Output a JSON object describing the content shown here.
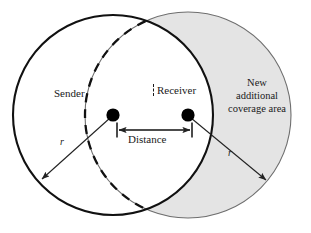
{
  "figure": {
    "type": "geometry-diagram",
    "background_color": "#ffffff"
  },
  "colors": {
    "stroke_primary": "#111111",
    "stroke_secondary": "#555555",
    "shaded_area_fill": "#e4e4e4",
    "shaded_area_stroke": "#6e6e6e",
    "node_fill": "#000000",
    "text": "#1a1a1a"
  },
  "shapes": {
    "sender_circle": {
      "name": "sender-coverage-circle",
      "cx": 113,
      "cy": 115,
      "r": 100,
      "stroke": "solid",
      "fill": "none"
    },
    "receiver_circle": {
      "name": "receiver-coverage-circle",
      "cx": 188,
      "cy": 115,
      "r": 103,
      "stroke": "solid-thin",
      "fill": "shaded"
    },
    "receiver_circle_hidden_arc": {
      "name": "receiver-circle-overlap-arc",
      "stroke": "dashed"
    },
    "sender_node": {
      "cx": 113,
      "cy": 115,
      "r": 6.5
    },
    "receiver_node": {
      "cx": 188,
      "cy": 115,
      "r": 6.5
    }
  },
  "labels": {
    "sender": "Sender",
    "receiver": "Receiver",
    "distance": "Distance",
    "coverage_area": "New additional coverage area",
    "radius_left": "r",
    "radius_right": "r"
  },
  "measurements": {
    "distance_arrow": {
      "name": "distance-measure",
      "x1": 117,
      "x2": 192,
      "y": 130,
      "double_headed": true,
      "end_caps": "tick"
    },
    "radius_left_arrow": {
      "from_x": 113,
      "from_y": 115,
      "to_x": 40,
      "to_y": 181
    },
    "radius_right_arrow": {
      "from_x": 188,
      "from_y": 115,
      "to_x": 268,
      "to_y": 182
    }
  }
}
